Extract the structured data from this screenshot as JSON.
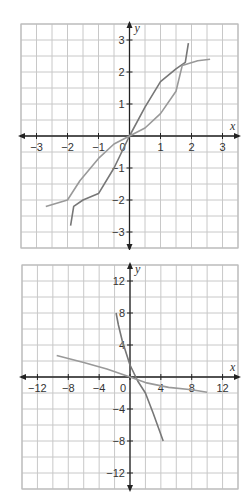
{
  "chart_data": [
    {
      "type": "line",
      "title": "",
      "xlabel": "x",
      "ylabel": "y",
      "xlim": [
        -3.5,
        3.5
      ],
      "ylim": [
        -3.5,
        3.5
      ],
      "grid": true,
      "grid_step": 0.5,
      "x_ticks": [
        "-3",
        "-2",
        "-1",
        "0",
        "1",
        "2",
        "3"
      ],
      "y_ticks": [
        "3",
        "2",
        "1",
        "-1",
        "-2",
        "-3"
      ],
      "series": [
        {
          "name": "curve-steep",
          "color": "#777777",
          "x": [
            -1.9,
            -1.8,
            -1.5,
            -1,
            -0.5,
            0,
            0.5,
            1,
            1.5,
            1.8,
            1.9
          ],
          "y": [
            -2.8,
            -2.2,
            -2.0,
            -1.8,
            -1.0,
            0,
            0.9,
            1.7,
            2.1,
            2.3,
            2.9
          ]
        },
        {
          "name": "curve-flat",
          "color": "#999999",
          "x": [
            -2.7,
            -2.0,
            -1.6,
            -1,
            -0.5,
            0,
            0.5,
            1,
            1.5,
            1.7,
            2.2,
            2.6
          ],
          "y": [
            -2.2,
            -2.0,
            -1.4,
            -0.7,
            -0.25,
            0,
            0.25,
            0.7,
            1.4,
            2.2,
            2.35,
            2.4
          ]
        }
      ]
    },
    {
      "type": "line",
      "title": "",
      "xlabel": "x",
      "ylabel": "y",
      "xlim": [
        -14,
        14
      ],
      "ylim": [
        -14,
        14
      ],
      "grid": true,
      "grid_step": 2,
      "x_ticks": [
        "-12",
        "-8",
        "-4",
        "0",
        "4",
        "8",
        "12"
      ],
      "y_ticks": [
        "12",
        "8",
        "4",
        "-4",
        "-8",
        "-12"
      ],
      "series": [
        {
          "name": "curve-steep",
          "color": "#777777",
          "x": [
            -1.8,
            -1.5,
            -1,
            0,
            1,
            2,
            3,
            4.3
          ],
          "y": [
            8,
            6.5,
            4.5,
            1.5,
            -0.5,
            -2,
            -4.5,
            -8
          ]
        },
        {
          "name": "curve-flat",
          "color": "#999999",
          "x": [
            -9.5,
            -6,
            -3,
            0,
            2,
            5,
            8,
            10
          ],
          "y": [
            2.7,
            1.8,
            1.0,
            0,
            -0.7,
            -1.3,
            -1.6,
            -1.9
          ]
        }
      ]
    }
  ]
}
